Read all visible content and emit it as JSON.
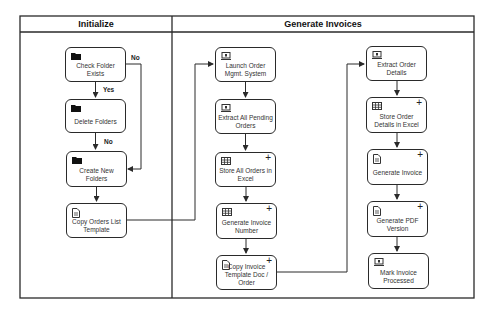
{
  "diagram": {
    "lanes": [
      {
        "id": "initialize",
        "title": "Initialize"
      },
      {
        "id": "generate",
        "title": "Generate Invoices"
      }
    ],
    "nodes": {
      "check_folder": {
        "label": "Check Folder Exists",
        "icon": "folder-icon",
        "subprocess": false
      },
      "delete_folders": {
        "label": "Delete Folders",
        "icon": "folder-icon",
        "subprocess": false
      },
      "create_folders": {
        "label": "Create New Folders",
        "icon": "folder-icon",
        "subprocess": false
      },
      "copy_orders_template": {
        "label": "Copy Orders List Template",
        "icon": "document-icon",
        "subprocess": false
      },
      "launch_oms": {
        "label": "Launch Order Mgmt. System",
        "icon": "application-icon",
        "subprocess": false
      },
      "extract_pending": {
        "label": "Extract All Pending Orders",
        "icon": "application-icon",
        "subprocess": false
      },
      "store_orders_excel": {
        "label": "Store All Orders in Excel",
        "icon": "spreadsheet-icon",
        "subprocess": true
      },
      "generate_invoice_number": {
        "label": "Generate Invoice Number",
        "icon": "spreadsheet-icon",
        "subprocess": true
      },
      "copy_invoice_template": {
        "label": "Copy Invoice Template Doc / Order",
        "icon": "document-icon",
        "subprocess": true
      },
      "extract_order_details": {
        "label": "Extract Order Details",
        "icon": "application-icon",
        "subprocess": false
      },
      "store_order_details": {
        "label": "Store Order Details in Excel",
        "icon": "spreadsheet-icon",
        "subprocess": true
      },
      "generate_invoice": {
        "label": "Generate Invoice",
        "icon": "document-icon",
        "subprocess": true
      },
      "generate_pdf": {
        "label": "Generate PDF Version",
        "icon": "document-icon",
        "subprocess": true
      },
      "mark_processed": {
        "label": "Mark Invoice Processed",
        "icon": "application-icon",
        "subprocess": false
      }
    },
    "edge_labels": {
      "check_yes": "Yes",
      "check_no": "No",
      "delete_no": "No"
    },
    "edges": [
      {
        "from": "check_folder",
        "to": "delete_folders",
        "label": "Yes"
      },
      {
        "from": "check_folder",
        "to": "create_folders",
        "label": "No"
      },
      {
        "from": "delete_folders",
        "to": "create_folders",
        "label": "No"
      },
      {
        "from": "create_folders",
        "to": "copy_orders_template"
      },
      {
        "from": "copy_orders_template",
        "to": "launch_oms"
      },
      {
        "from": "launch_oms",
        "to": "extract_pending"
      },
      {
        "from": "extract_pending",
        "to": "store_orders_excel"
      },
      {
        "from": "store_orders_excel",
        "to": "generate_invoice_number"
      },
      {
        "from": "generate_invoice_number",
        "to": "copy_invoice_template"
      },
      {
        "from": "copy_invoice_template",
        "to": "extract_order_details"
      },
      {
        "from": "extract_order_details",
        "to": "store_order_details"
      },
      {
        "from": "store_order_details",
        "to": "generate_invoice"
      },
      {
        "from": "generate_invoice",
        "to": "generate_pdf"
      },
      {
        "from": "generate_pdf",
        "to": "mark_processed"
      }
    ],
    "subprocess_marker": "+",
    "colors": {
      "stroke": "#2a2a2a",
      "text": "#333333",
      "background": "#ffffff"
    }
  }
}
